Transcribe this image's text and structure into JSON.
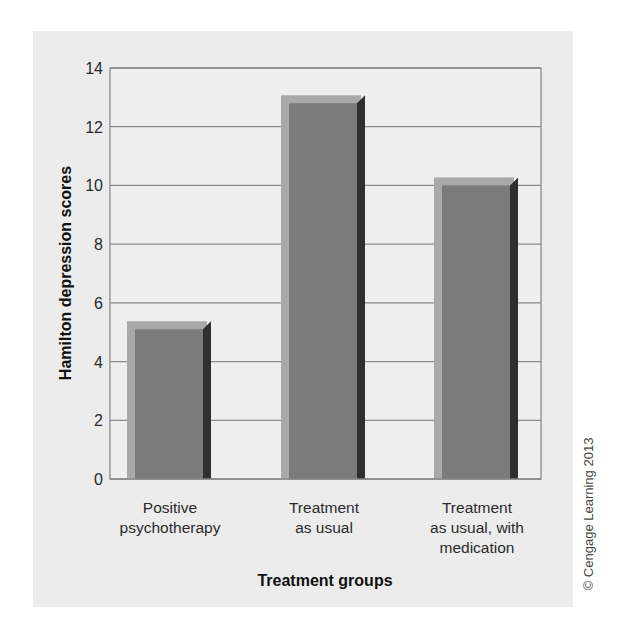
{
  "chart_data": {
    "type": "bar",
    "title": "",
    "xlabel": "Treatment groups",
    "ylabel": "Hamilton depression scores",
    "categories": [
      "Positive psychotherapy",
      "Treatment as usual",
      "Treatment as usual, with medication"
    ],
    "category_lines": [
      [
        "Positive",
        "psychotherapy"
      ],
      [
        "Treatment",
        "as usual"
      ],
      [
        "Treatment",
        "as usual, with",
        "medication"
      ]
    ],
    "values": [
      5.1,
      12.8,
      10.0
    ],
    "ylim": [
      0,
      14
    ],
    "yticks": [
      0,
      2,
      4,
      6,
      8,
      10,
      12,
      14
    ],
    "grid": true,
    "legend": null,
    "style": "3d-bar"
  },
  "colors": {
    "panel_bg": "#ececec",
    "plot_bg": "#efefef",
    "gridline": "#8a8a8a",
    "bar_front": "#7b7b7b",
    "bar_back": "#a9a9a9",
    "bar_side": "#2f2f2f"
  },
  "credit": "© Cengage Learning 2013"
}
